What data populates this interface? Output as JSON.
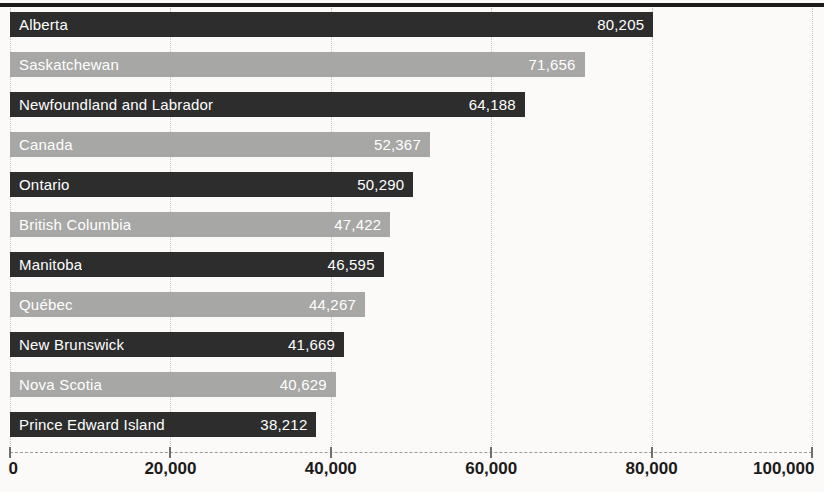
{
  "chart_data": {
    "type": "bar",
    "orientation": "horizontal",
    "title": "",
    "xlabel": "",
    "ylabel": "",
    "categories": [
      "Alberta",
      "Saskatchewan",
      "Newfoundland and Labrador",
      "Canada",
      "Ontario",
      "British Columbia",
      "Manitoba",
      "Québec",
      "New Brunswick",
      "Nova Scotia",
      "Prince Edward Island"
    ],
    "values": [
      80205,
      71656,
      64188,
      52367,
      50290,
      47422,
      46595,
      44267,
      41669,
      40629,
      38212
    ],
    "value_labels": [
      "80,205",
      "71,656",
      "64,188",
      "52,367",
      "50,290",
      "47,422",
      "46,595",
      "44,267",
      "41,669",
      "40,629",
      "38,212"
    ],
    "xlim": [
      0,
      100000
    ],
    "x_ticks": [
      {
        "value": 0,
        "label": "0"
      },
      {
        "value": 20000,
        "label": "20,000"
      },
      {
        "value": 40000,
        "label": "40,000"
      },
      {
        "value": 60000,
        "label": "60,000"
      },
      {
        "value": 80000,
        "label": "80,000"
      },
      {
        "value": 100000,
        "label": "100,000"
      }
    ],
    "grid": "vertical-dotted",
    "legend_position": "none",
    "bar_color_pattern": [
      "dark",
      "light"
    ],
    "colors": {
      "dark_bar": "#2d2d2d",
      "light_bar": "#a7a7a5",
      "bar_text": "#ffffff",
      "axis_text": "#1b1b1b",
      "gridline": "#c3c3c0",
      "top_rule": "#1c1c1c",
      "background": "#fbfaf8"
    }
  }
}
